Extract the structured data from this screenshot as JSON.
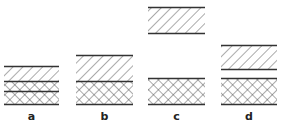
{
  "figure": {
    "line_color": "#333333",
    "panels": [
      {
        "label": "a",
        "x": 4,
        "w": 55,
        "layers": [
          {
            "type": "diagonal-hatch",
            "top": 66,
            "bottom": 81
          },
          {
            "type": "cross-hatch",
            "top": 81,
            "bottom": 91
          },
          {
            "type": "cross-hatch",
            "top": 91,
            "bottom": 104
          }
        ]
      },
      {
        "label": "b",
        "x": 76,
        "w": 57,
        "layers": [
          {
            "type": "diagonal-hatch",
            "top": 55,
            "bottom": 81
          },
          {
            "type": "cross-hatch",
            "top": 81,
            "bottom": 104
          }
        ]
      },
      {
        "label": "c",
        "x": 148,
        "w": 57,
        "layers": [
          {
            "type": "diagonal-hatch",
            "top": 7,
            "bottom": 33
          },
          {
            "type": "cross-hatch",
            "top": 78,
            "bottom": 104
          }
        ]
      },
      {
        "label": "d",
        "x": 221,
        "w": 56,
        "layers": [
          {
            "type": "diagonal-hatch",
            "top": 45,
            "bottom": 69
          },
          {
            "type": "cross-hatch",
            "top": 78,
            "bottom": 104
          }
        ]
      }
    ]
  }
}
